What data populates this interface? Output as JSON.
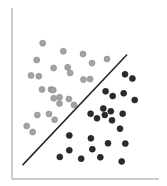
{
  "chart_data": {
    "type": "scatter",
    "title": "",
    "xlabel": "",
    "ylabel": "",
    "xlim": [
      0,
      100
    ],
    "ylim": [
      0,
      100
    ],
    "grid": false,
    "legend": null,
    "tick_labels": false,
    "colors": {
      "class_a": "#a3a3a3",
      "class_a_edge": "#8a8a8a",
      "class_b": "#2b2b2b",
      "class_b_edge": "#1e1e1e",
      "axis": "#9a9a9a",
      "boundary": "#2a2a2a"
    },
    "series": [
      {
        "name": "class_a",
        "x": [
          20.9,
          34.9,
          48.3,
          64.6,
          16.8,
          28.3,
          37.9,
          39.5,
          54.4,
          12.9,
          18.2,
          48.6,
          26.5,
          20.4,
          28.1,
          28.4,
          32.3,
          38.7,
          32.3,
          42.2,
          17.2,
          25.2,
          29.0,
          10.0,
          14.1,
          53.1
        ],
        "y": [
          79.4,
          74.7,
          73.1,
          70.2,
          69.6,
          64.9,
          65.3,
          62.0,
          67.8,
          60.6,
          60.1,
          58.1,
          52.4,
          52.4,
          52.0,
          47.2,
          47.8,
          46.8,
          44.1,
          43.3,
          37.4,
          38.0,
          34.7,
          31.0,
          27.5,
          58.4
        ]
      },
      {
        "name": "class_b",
        "x": [
          76.9,
          81.9,
          63.7,
          68.5,
          76.0,
          83.5,
          62.1,
          53.5,
          57.8,
          63.1,
          67.2,
          68.0,
          75.3,
          73.5,
          39.0,
          53.7,
          65.3,
          77.1,
          39.0,
          54.6,
          32.5,
          47.1,
          60.1,
          74.6
        ],
        "y": [
          61.2,
          58.8,
          51.3,
          48.5,
          50.1,
          46.2,
          41.2,
          38.2,
          35.5,
          37.4,
          39.6,
          34.3,
          38.2,
          29.4,
          25.5,
          23.8,
          20.9,
          20.7,
          16.8,
          17.4,
          12.9,
          11.9,
          12.7,
          10.3
        ]
      }
    ],
    "decision_boundary": {
      "type": "line",
      "from": [
        7.5,
        8.4
      ],
      "to": [
        78.0,
        72.5
      ]
    }
  },
  "plot_area": {
    "origin_px": [
      12,
      179
    ],
    "width_px": 147,
    "height_px": 171,
    "point_radius_px": 3
  }
}
